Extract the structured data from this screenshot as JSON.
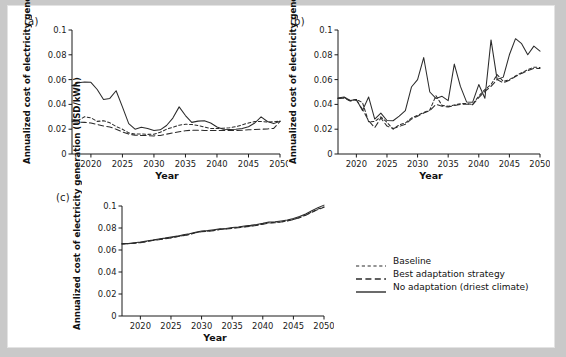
{
  "figure": {
    "background": "#c9c9c9",
    "panel_background": "#ffffff",
    "line_color": "#2b2b2b"
  },
  "legend": {
    "name": "legend",
    "items": [
      {
        "label": "Baseline",
        "style": "short-dash"
      },
      {
        "label": "Best adaptation strategy",
        "style": "long-dash"
      },
      {
        "label": "No adaptation (driest climate)",
        "style": "solid"
      }
    ]
  },
  "panels": [
    {
      "id": "a",
      "label": "(a)"
    },
    {
      "id": "b",
      "label": "(b)"
    },
    {
      "id": "c",
      "label": "(c)"
    }
  ],
  "chart_data": [
    {
      "type": "line",
      "panel": "(a)",
      "title": "",
      "xlabel": "Year",
      "ylabel": "Annualized cost of electricity generation (USD/kWh)",
      "xlim": [
        2017,
        2050
      ],
      "ylim": [
        0,
        0.1
      ],
      "xticks": [
        2020,
        2025,
        2030,
        2035,
        2040,
        2045,
        2050
      ],
      "yticks": [
        0,
        0.02,
        0.04,
        0.06,
        0.08,
        0.1
      ],
      "ytick_labels": [
        "0",
        "0.02",
        "0.04",
        "0.06",
        "0.08",
        "0.1"
      ],
      "grid": false,
      "legend_position": "external-right",
      "x": [
        2017,
        2018,
        2019,
        2020,
        2021,
        2022,
        2023,
        2024,
        2025,
        2026,
        2027,
        2028,
        2029,
        2030,
        2031,
        2032,
        2033,
        2034,
        2035,
        2036,
        2037,
        2038,
        2039,
        2040,
        2041,
        2042,
        2043,
        2044,
        2045,
        2046,
        2047,
        2048,
        2049,
        2050
      ],
      "series": [
        {
          "name": "Baseline",
          "style": "short-dash",
          "values": [
            0.0275,
            0.0272,
            0.03,
            0.0292,
            0.0263,
            0.0268,
            0.0252,
            0.0222,
            0.02,
            0.017,
            0.016,
            0.0162,
            0.0158,
            0.016,
            0.0175,
            0.02,
            0.0215,
            0.0232,
            0.024,
            0.0238,
            0.023,
            0.0218,
            0.0206,
            0.0205,
            0.0208,
            0.0212,
            0.022,
            0.0235,
            0.025,
            0.0262,
            0.0262,
            0.0258,
            0.026,
            0.0265
          ]
        },
        {
          "name": "Best adaptation strategy",
          "style": "long-dash",
          "values": [
            0.0262,
            0.0258,
            0.0255,
            0.025,
            0.0238,
            0.0226,
            0.0218,
            0.02,
            0.0178,
            0.016,
            0.0152,
            0.015,
            0.0148,
            0.0146,
            0.015,
            0.016,
            0.017,
            0.018,
            0.0188,
            0.0192,
            0.0192,
            0.019,
            0.019,
            0.019,
            0.019,
            0.019,
            0.019,
            0.0192,
            0.0195,
            0.0198,
            0.02,
            0.0202,
            0.0206,
            0.0262
          ]
        },
        {
          "name": "No adaptation (driest climate)",
          "style": "solid",
          "values": [
            0.055,
            0.0575,
            0.058,
            0.0578,
            0.052,
            0.044,
            0.0448,
            0.051,
            0.038,
            0.0245,
            0.02,
            0.0215,
            0.0205,
            0.019,
            0.0195,
            0.023,
            0.029,
            0.038,
            0.031,
            0.0255,
            0.0265,
            0.0268,
            0.025,
            0.0218,
            0.02,
            0.0198,
            0.02,
            0.0205,
            0.022,
            0.025,
            0.03,
            0.0262,
            0.0245,
            0.0265
          ]
        }
      ]
    },
    {
      "type": "line",
      "panel": "(b)",
      "title": "",
      "xlabel": "Year",
      "ylabel": "Annualized cost of electricity generation (USD/kWh)",
      "xlim": [
        2017,
        2050
      ],
      "ylim": [
        0,
        0.1
      ],
      "xticks": [
        2020,
        2025,
        2030,
        2035,
        2040,
        2045,
        2050
      ],
      "yticks": [
        0,
        0.02,
        0.04,
        0.06,
        0.08,
        0.1
      ],
      "ytick_labels": [
        "0",
        "0.02",
        "0.04",
        "0.06",
        "0.08",
        "0.1"
      ],
      "grid": false,
      "legend_position": "external-right",
      "x": [
        2017,
        2018,
        2019,
        2020,
        2021,
        2022,
        2023,
        2024,
        2025,
        2026,
        2027,
        2028,
        2029,
        2030,
        2031,
        2032,
        2033,
        2034,
        2035,
        2036,
        2037,
        2038,
        2039,
        2040,
        2041,
        2042,
        2043,
        2044,
        2045,
        2046,
        2047,
        2048,
        2049,
        2050
      ],
      "series": [
        {
          "name": "Baseline",
          "style": "short-dash",
          "values": [
            0.045,
            0.0455,
            0.043,
            0.044,
            0.0415,
            0.026,
            0.0262,
            0.03,
            0.0255,
            0.02,
            0.0235,
            0.025,
            0.029,
            0.0312,
            0.0335,
            0.0355,
            0.047,
            0.0392,
            0.0385,
            0.0395,
            0.0405,
            0.0408,
            0.04,
            0.0468,
            0.052,
            0.056,
            0.064,
            0.0585,
            0.06,
            0.063,
            0.0655,
            0.068,
            0.07,
            0.0698
          ]
        },
        {
          "name": "Best adaptation strategy",
          "style": "long-dash",
          "values": [
            0.0448,
            0.045,
            0.0428,
            0.0435,
            0.036,
            0.0268,
            0.0212,
            0.029,
            0.0225,
            0.0205,
            0.0222,
            0.024,
            0.0282,
            0.0305,
            0.033,
            0.035,
            0.04,
            0.0385,
            0.038,
            0.039,
            0.04,
            0.0402,
            0.0398,
            0.0455,
            0.0505,
            0.0545,
            0.06,
            0.0575,
            0.0595,
            0.0625,
            0.065,
            0.0672,
            0.069,
            0.069
          ]
        },
        {
          "name": "No adaptation (driest climate)",
          "style": "solid",
          "values": [
            0.0452,
            0.046,
            0.0432,
            0.044,
            0.035,
            0.046,
            0.0282,
            0.033,
            0.027,
            0.0268,
            0.0305,
            0.035,
            0.054,
            0.06,
            0.0778,
            0.05,
            0.0448,
            0.0465,
            0.043,
            0.0725,
            0.0545,
            0.042,
            0.0418,
            0.056,
            0.045,
            0.092,
            0.06,
            0.062,
            0.08,
            0.093,
            0.089,
            0.08,
            0.087,
            0.083
          ]
        }
      ]
    },
    {
      "type": "line",
      "panel": "(c)",
      "title": "",
      "xlabel": "Year",
      "ylabel": "Annualized cost of electricity generation (USD/kWh)",
      "xlim": [
        2017,
        2050
      ],
      "ylim": [
        0,
        0.1
      ],
      "xticks": [
        2020,
        2025,
        2030,
        2035,
        2040,
        2045,
        2050
      ],
      "yticks": [
        0,
        0.02,
        0.04,
        0.06,
        0.08,
        0.1
      ],
      "ytick_labels": [
        "0",
        "0.02",
        "0.04",
        "0.06",
        "0.08",
        "0.1"
      ],
      "grid": false,
      "legend_position": "external-right",
      "x": [
        2017,
        2018,
        2019,
        2020,
        2021,
        2022,
        2023,
        2024,
        2025,
        2026,
        2027,
        2028,
        2029,
        2030,
        2031,
        2032,
        2033,
        2034,
        2035,
        2036,
        2037,
        2038,
        2039,
        2040,
        2041,
        2042,
        2043,
        2044,
        2045,
        2046,
        2047,
        2048,
        2049,
        2050
      ],
      "series": [
        {
          "name": "Baseline",
          "style": "short-dash",
          "values": [
            0.0655,
            0.0658,
            0.0662,
            0.0668,
            0.0678,
            0.0688,
            0.0696,
            0.0704,
            0.0712,
            0.0722,
            0.0732,
            0.0742,
            0.0758,
            0.0768,
            0.0772,
            0.0778,
            0.0788,
            0.0792,
            0.0798,
            0.0805,
            0.0812,
            0.0818,
            0.0826,
            0.0836,
            0.0848,
            0.085,
            0.0856,
            0.0866,
            0.0878,
            0.0896,
            0.0918,
            0.0945,
            0.0972,
            0.0992
          ]
        },
        {
          "name": "Best adaptation strategy",
          "style": "long-dash",
          "values": [
            0.0654,
            0.0657,
            0.0661,
            0.0666,
            0.0676,
            0.0686,
            0.0694,
            0.0702,
            0.071,
            0.072,
            0.073,
            0.074,
            0.0756,
            0.0766,
            0.077,
            0.0776,
            0.0786,
            0.079,
            0.0796,
            0.0803,
            0.081,
            0.0816,
            0.0824,
            0.0834,
            0.0846,
            0.0848,
            0.0854,
            0.0864,
            0.0876,
            0.0894,
            0.0916,
            0.0942,
            0.0968,
            0.0988
          ]
        },
        {
          "name": "No adaptation (driest climate)",
          "style": "solid",
          "values": [
            0.0658,
            0.066,
            0.0666,
            0.0672,
            0.0682,
            0.069,
            0.07,
            0.0708,
            0.0718,
            0.0726,
            0.0738,
            0.0748,
            0.0762,
            0.0772,
            0.0776,
            0.0784,
            0.0792,
            0.0796,
            0.0804,
            0.081,
            0.0818,
            0.0824,
            0.0832,
            0.0842,
            0.0854,
            0.0856,
            0.0864,
            0.0872,
            0.0886,
            0.0904,
            0.0928,
            0.0956,
            0.0985,
            0.1008
          ]
        }
      ]
    }
  ]
}
